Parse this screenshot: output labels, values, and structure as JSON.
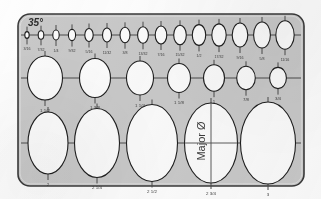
{
  "page": {
    "background_color": "#fdfdfd"
  },
  "template": {
    "name": "35 degree ellipse template",
    "angle_label": "35°",
    "body_color": "#c9c9c9",
    "edge_color": "#3a3a3a",
    "cutout_color": "#fbfbfb",
    "line_color": "#4a4a4a",
    "label_color": "#3c3c3c",
    "frame": {
      "x": 18,
      "y": 14,
      "w": 286,
      "h": 172,
      "radius": 12
    },
    "major_axis_label": "Major Ø",
    "rows": [
      {
        "name": "small-sizes-row",
        "axis_y": 35,
        "axis_x1": 21,
        "axis_x2": 301,
        "ellipses": [
          {
            "cx": 27,
            "rx": 2.2,
            "ry": 3.4,
            "label": "3/16"
          },
          {
            "cx": 41,
            "rx": 2.8,
            "ry": 4.3,
            "label": "7/32"
          },
          {
            "cx": 56,
            "rx": 3.2,
            "ry": 5.0,
            "label": "1/4"
          },
          {
            "cx": 72,
            "rx": 3.6,
            "ry": 5.6,
            "label": "9/32"
          },
          {
            "cx": 89,
            "rx": 4.2,
            "ry": 6.5,
            "label": "5/16"
          },
          {
            "cx": 107,
            "rx": 4.5,
            "ry": 7.0,
            "label": "11/32"
          },
          {
            "cx": 125,
            "rx": 5.0,
            "ry": 7.7,
            "label": "3/8"
          },
          {
            "cx": 143,
            "rx": 5.4,
            "ry": 8.3,
            "label": "13/32"
          },
          {
            "cx": 161,
            "rx": 5.8,
            "ry": 9.0,
            "label": "7/16"
          },
          {
            "cx": 180,
            "rx": 6.3,
            "ry": 9.7,
            "label": "15/32"
          },
          {
            "cx": 199,
            "rx": 6.7,
            "ry": 10.4,
            "label": "1/2"
          },
          {
            "cx": 219,
            "rx": 7.2,
            "ry": 11.1,
            "label": "17/32"
          },
          {
            "cx": 240,
            "rx": 7.8,
            "ry": 12.0,
            "label": "9/16"
          },
          {
            "cx": 262,
            "rx": 8.4,
            "ry": 13.0,
            "label": "5/8"
          },
          {
            "cx": 285,
            "rx": 9.2,
            "ry": 14.2,
            "label": "11/16"
          }
        ]
      },
      {
        "name": "medium-sizes-row",
        "axis_y": 78,
        "axis_x1": 21,
        "axis_x2": 301,
        "ellipses": [
          {
            "cx": 45,
            "rx": 17.5,
            "ry": 22.0,
            "label": "1 1/2"
          },
          {
            "cx": 95,
            "rx": 15.5,
            "ry": 19.5,
            "label": "1 3/8"
          },
          {
            "cx": 140,
            "rx": 13.5,
            "ry": 17.0,
            "label": "1 1/4"
          },
          {
            "cx": 179,
            "rx": 11.5,
            "ry": 14.5,
            "label": "1 1/8"
          },
          {
            "cx": 214,
            "rx": 10.5,
            "ry": 13.2,
            "label": "1"
          },
          {
            "cx": 246,
            "rx": 9.3,
            "ry": 11.7,
            "label": "7/8"
          },
          {
            "cx": 278,
            "rx": 8.4,
            "ry": 10.6,
            "label": "3/4"
          }
        ]
      },
      {
        "name": "large-sizes-row",
        "axis_y": 143,
        "axis_x1": 21,
        "axis_x2": 301,
        "ellipses": [
          {
            "cx": 48,
            "rx": 20.0,
            "ry": 31.0,
            "label": "2",
            "annotated": false
          },
          {
            "cx": 97,
            "rx": 22.5,
            "ry": 34.5,
            "label": "2 1/4",
            "annotated": false
          },
          {
            "cx": 152,
            "rx": 25.5,
            "ry": 38.5,
            "label": "2 1/2",
            "annotated": false
          },
          {
            "cx": 211,
            "rx": 26.5,
            "ry": 40.0,
            "label": "2 3/4",
            "annotated": true
          },
          {
            "cx": 268,
            "rx": 27.5,
            "ry": 41.0,
            "label": "3",
            "annotated": false
          }
        ]
      }
    ]
  }
}
